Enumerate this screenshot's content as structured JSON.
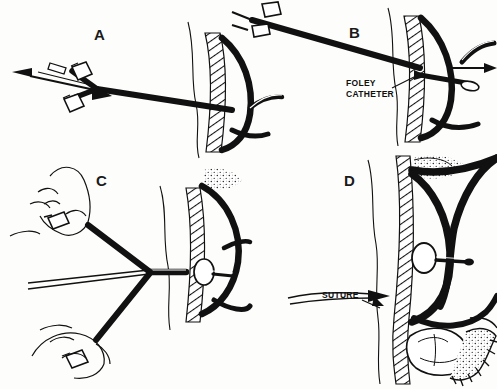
{
  "figure": {
    "style": "black-and-white line drawing",
    "ink_color": "#111111",
    "background_color": "#fdfdfb",
    "panel_count": 4
  },
  "panels": [
    {
      "id": "A",
      "letter": "A",
      "description": "Trifurcated catheter hub with two side ports pulled leftward through abdominal wall; arrow points left"
    },
    {
      "id": "B",
      "letter": "B",
      "description": "Catheter advanced through abdominal wall into stomach; Foley catheter tip shown inside with arrow to the right"
    },
    {
      "id": "C",
      "letter": "C",
      "description": "Two hands grasp catheter limbs; balloon seated against inner stomach wall"
    },
    {
      "id": "D",
      "letter": "D",
      "description": "Suture secured at skin level; balloon inflated inside stomach with surrounding viscera"
    }
  ],
  "callouts": [
    {
      "id": "foley-catheter",
      "text": "FOLEY\nCATHETER",
      "panel": "B"
    },
    {
      "id": "suture",
      "text": "SUTURE",
      "panel": "D"
    }
  ]
}
